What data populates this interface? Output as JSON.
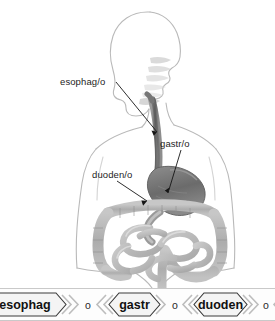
{
  "illustration": {
    "alt_title": "Human digestive tract anatomical diagram",
    "labels": [
      {
        "id": "esophagus",
        "text": "esophag/o",
        "x": 60,
        "y": 85
      },
      {
        "id": "stomach",
        "text": "gastr/o",
        "x": 160,
        "y": 147
      },
      {
        "id": "duodenum",
        "text": "duoden/o",
        "x": 92,
        "y": 178
      }
    ],
    "colors": {
      "body_outline": "#b9b9b9",
      "esophagus": "#6e6e6e",
      "stomach": "#7a7a7a",
      "intestine": "#b3b3b3",
      "leader_line": "#151515",
      "background": "#ffffff"
    }
  },
  "wordstrip": {
    "chips": [
      {
        "id": "esophag",
        "label": "esophag"
      },
      {
        "id": "gastr",
        "label": "gastr"
      },
      {
        "id": "duoden",
        "label": "duoden"
      },
      {
        "id": "scopy",
        "label": "scopy"
      }
    ],
    "joiners": [
      {
        "id": "joiner-1",
        "label": "o"
      },
      {
        "id": "joiner-2",
        "label": "o"
      },
      {
        "id": "joiner-3",
        "label": "o"
      }
    ],
    "colors": {
      "chip_fill": "#f4f4f4",
      "chip_stroke": "#3a3a3a",
      "chevron": "#bdbdbd",
      "strip_bg": "#fdfdfd",
      "strip_border": "#c9c9c9"
    }
  }
}
